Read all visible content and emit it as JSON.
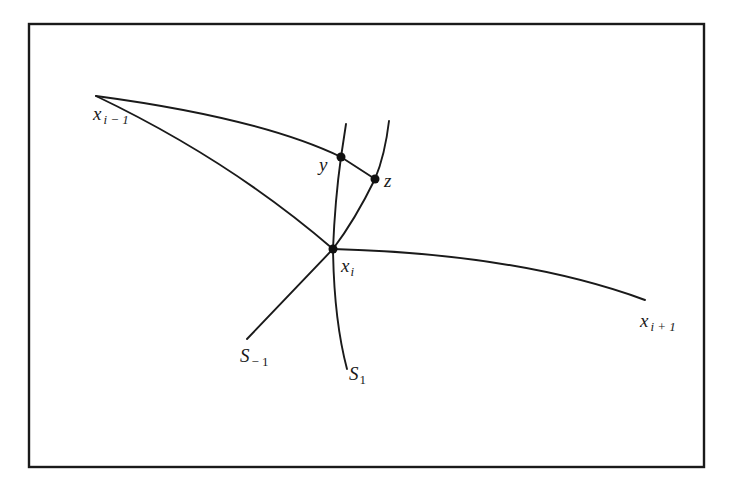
{
  "figure": {
    "frame": {
      "x": 29,
      "y": 24,
      "width": 675,
      "height": 443
    },
    "colors": {
      "ink": "#1a1a1a",
      "background": "#ffffff"
    },
    "points": {
      "x_prev": {
        "x": 96,
        "y": 96
      },
      "y": {
        "x": 341,
        "y": 157
      },
      "z": {
        "x": 375,
        "y": 179
      },
      "x_i": {
        "x": 333,
        "y": 249
      },
      "x_next": {
        "x": 645,
        "y": 300
      },
      "s_minus1_end": {
        "x": 247,
        "y": 339
      },
      "s_1_end": {
        "x": 347,
        "y": 369
      }
    },
    "labels": {
      "x_prev": {
        "base": "x",
        "sub": "i − 1"
      },
      "y": {
        "base": "y"
      },
      "z": {
        "base": "z"
      },
      "x_i": {
        "base": "x",
        "sub": "i"
      },
      "x_next": {
        "base": "x",
        "sub": "i + 1"
      },
      "s_minus1": {
        "base": "S",
        "sub": "− 1"
      },
      "s_1": {
        "base": "S",
        "sub": "1"
      }
    }
  }
}
